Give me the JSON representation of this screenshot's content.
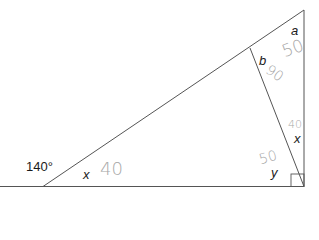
{
  "diagram": {
    "type": "geometry-triangle",
    "labels": {
      "exterior_angle": "140°",
      "angle_x_left": "x",
      "angle_a": "a",
      "angle_b": "b",
      "angle_x_right": "x",
      "angle_y": "y"
    },
    "handwritten_answers": {
      "x_left": "40",
      "a": "50",
      "b": "90",
      "x_right": "40",
      "y": "50"
    },
    "colors": {
      "line": "#555555",
      "label": "#1a1a1a",
      "handwriting": "#a8a8a8"
    }
  }
}
